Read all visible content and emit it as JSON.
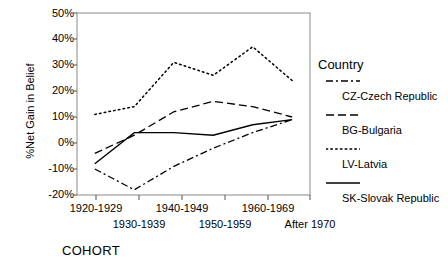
{
  "chart_data": {
    "type": "line",
    "title": "",
    "xlabel": "COHORT",
    "ylabel": "%Net Gain in Belief",
    "categories": [
      "1920-1929",
      "1930-1939",
      "1940-1949",
      "1950-1959",
      "1960-1969",
      "After 1970"
    ],
    "ylim": [
      -20,
      50
    ],
    "ytick_labels": [
      "50%",
      "40%",
      "30%",
      "20%",
      "10%",
      "0%",
      "-10%",
      "-20%"
    ],
    "ytick_values": [
      50,
      40,
      30,
      20,
      10,
      0,
      -10,
      -20
    ],
    "grid": false,
    "legend_position": "right",
    "legend_title": "Country",
    "series": [
      {
        "name": "CZ-Czech Republic",
        "code": "CZ",
        "style": "dash-dot",
        "values": [
          -10,
          -18,
          -9,
          -2,
          4,
          9
        ]
      },
      {
        "name": "BG-Bulgaria",
        "code": "BG",
        "style": "dotted",
        "values": [
          11,
          14,
          31,
          26,
          37,
          24
        ]
      },
      {
        "name": "LV-Latvia",
        "code": "LV",
        "style": "dashed",
        "values": [
          -4,
          3,
          12,
          16,
          14,
          10
        ]
      },
      {
        "name": "SK-Slovak Republic",
        "code": "SK",
        "style": "solid",
        "values": [
          -8,
          4,
          4,
          3,
          7,
          9
        ]
      }
    ]
  },
  "axis": {
    "y_title": "%Net Gain in Belief",
    "x_title": "COHORT"
  },
  "legend": {
    "title": "Country",
    "items": [
      {
        "label": "CZ-Czech Republic",
        "style": "dash-dot"
      },
      {
        "label": "BG-Bulgaria",
        "style": "dashed"
      },
      {
        "label": "LV-Latvia",
        "style": "dotted"
      },
      {
        "label": "SK-Slovak Republic",
        "style": "solid"
      }
    ]
  },
  "colors": {
    "line": "#000000",
    "axis": "#555555",
    "background": "#ffffff"
  }
}
